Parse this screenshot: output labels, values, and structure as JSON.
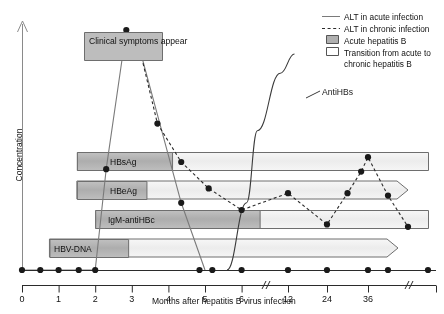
{
  "figure": {
    "y_axis_label": "Concentration",
    "x_axis_label": "Months after hepatitis B virus infection",
    "annotations": {
      "clinical_symptoms": "Clinical symptoms appear",
      "antihbs": "AntiHBs"
    }
  },
  "legend": {
    "items": [
      {
        "label": "ALT in acute infection",
        "swatch": "solid-line"
      },
      {
        "label": "ALT in chronic infection",
        "swatch": "dashed-line"
      },
      {
        "label": "Acute hepatitis B",
        "swatch": "filled-box"
      },
      {
        "label": "Transition from acute to chronic hepatitis B",
        "swatch": "empty-box"
      }
    ]
  },
  "markers": [
    {
      "name": "HBsAg",
      "label": "HBsAg"
    },
    {
      "name": "HBeAg",
      "label": "HBeAg"
    },
    {
      "name": "IgM-antiHBc",
      "label": "IgM-antiHBc"
    },
    {
      "name": "HBV-DNA",
      "label": "HBV-DNA"
    }
  ],
  "colors": {
    "acute_fill": "#b3b3b3",
    "chronic_fill": "#efefef",
    "border": "#6e6e6e",
    "line": "#7a7a7a",
    "dot": "#1a1a1a",
    "callout_fill": "#bdbdbd"
  },
  "chart_data": {
    "type": "line",
    "title": "",
    "xlabel": "Months after hepatitis B virus infection",
    "ylabel": "Concentration",
    "xticks": [
      0,
      1,
      2,
      3,
      4,
      5,
      6,
      12,
      24,
      36
    ],
    "xtick_labels": [
      "0",
      "1",
      "2",
      "3",
      "4",
      "5",
      "6",
      "12",
      "24",
      "36"
    ],
    "axis_breaks": [
      9,
      42
    ],
    "grid": false,
    "legend_position": "top-right",
    "series": [
      {
        "name": "ALT in acute infection",
        "style": "solid",
        "points": [
          {
            "x": 0.0,
            "y": 0
          },
          {
            "x": 2.0,
            "y": 0
          },
          {
            "x": 2.3,
            "y": 42
          },
          {
            "x": 2.85,
            "y": 100
          },
          {
            "x": 3.2,
            "y": 93
          },
          {
            "x": 4.35,
            "y": 28
          },
          {
            "x": 5.0,
            "y": 0
          }
        ]
      },
      {
        "name": "ALT in chronic infection",
        "style": "dashed",
        "points": [
          {
            "x": 3.7,
            "y": 61
          },
          {
            "x": 4.35,
            "y": 45
          },
          {
            "x": 5.1,
            "y": 34
          },
          {
            "x": 6.0,
            "y": 25
          },
          {
            "x": 12.0,
            "y": 32
          },
          {
            "x": 24.0,
            "y": 19
          },
          {
            "x": 30.0,
            "y": 32
          },
          {
            "x": 34.0,
            "y": 41
          },
          {
            "x": 36.0,
            "y": 47
          },
          {
            "x": 39.0,
            "y": 31
          },
          {
            "x": 42.0,
            "y": 18
          }
        ]
      },
      {
        "name": "AntiHBs",
        "style": "solid",
        "points": [
          {
            "x": 5.6,
            "y": 0
          },
          {
            "x": 6.6,
            "y": 28
          },
          {
            "x": 8.0,
            "y": 58
          },
          {
            "x": 11.0,
            "y": 82
          },
          {
            "x": 14.0,
            "y": 90
          }
        ]
      }
    ],
    "baseline_points": [
      0,
      0.5,
      1.0,
      1.55,
      2.0,
      4.85,
      5.2,
      6.0,
      12,
      24,
      36,
      39,
      45
    ],
    "bars": [
      {
        "name": "HBsAg",
        "acute_start": 1.5,
        "acute_end": 4.1,
        "chronic_end": 45.0,
        "arrow": false
      },
      {
        "name": "HBeAg",
        "acute_start": 1.5,
        "acute_end": 3.4,
        "chronic_end": 42.0,
        "arrow": true
      },
      {
        "name": "IgM-antiHBc",
        "acute_start": 2.0,
        "acute_end": 8.3,
        "chronic_end": 45.0,
        "arrow": false
      },
      {
        "name": "HBV-DNA",
        "acute_start": 0.75,
        "acute_end": 2.9,
        "chronic_end": 40.5,
        "arrow": true
      }
    ]
  }
}
